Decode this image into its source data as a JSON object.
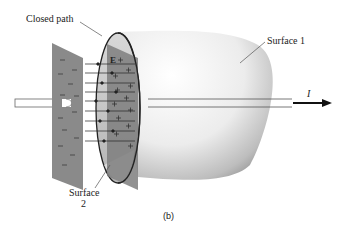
{
  "labels": {
    "closed_path": "Closed path",
    "surface1": "Surface 1",
    "surface2_line1": "Surface",
    "surface2_line2": "2",
    "current": "I",
    "field": "E",
    "caption": "(b)"
  },
  "plates": {
    "negative_symbol": "–",
    "positive_symbol": "+"
  },
  "colors": {
    "plate": "#8a8a8a",
    "surface_light": "#f4f4f4",
    "surface_dark": "#9a9a9a",
    "ellipse_fill": "#c8c8c8",
    "line": "#222222"
  }
}
